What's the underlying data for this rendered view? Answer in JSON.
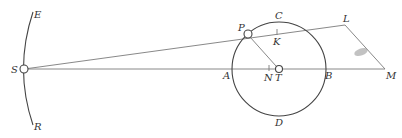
{
  "diagram": {
    "type": "geometric-astronomy-figure",
    "labels": {
      "E": "E",
      "S": "S",
      "R": "R",
      "P": "P",
      "C": "C",
      "K": "K",
      "L": "L",
      "A": "A",
      "N": "N",
      "T": "T",
      "B": "B",
      "M": "M",
      "D": "D"
    },
    "colors": {
      "line": "#7a7a7a",
      "stroke": "#444444",
      "text": "#333333",
      "smudge": "#9a9a9a"
    },
    "points": {
      "S": [
        24,
        69
      ],
      "T": [
        279,
        69
      ],
      "P": [
        248,
        34
      ],
      "K": [
        277,
        33
      ],
      "N": [
        269,
        68
      ],
      "L": [
        345,
        25
      ],
      "M": [
        385,
        69
      ]
    },
    "circle": {
      "center": "T",
      "radius": 47
    },
    "segments": [
      [
        "S",
        "L"
      ],
      [
        "S",
        "M"
      ],
      [
        "L",
        "M"
      ],
      [
        "P",
        "T"
      ]
    ],
    "arc": {
      "from": "E",
      "to": "R",
      "through": "S"
    }
  }
}
